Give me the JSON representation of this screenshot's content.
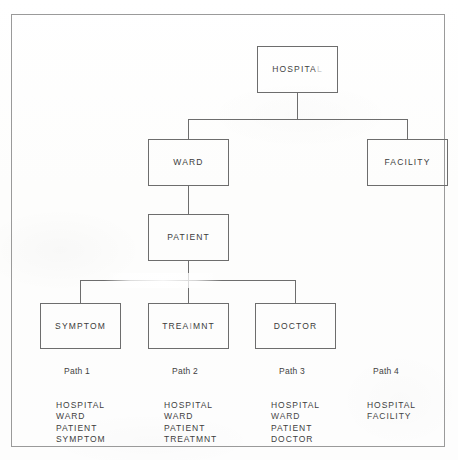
{
  "diagram": {
    "type": "hierarchical-tree",
    "title_present": false,
    "frame": {
      "border_color": "#9a9a9a"
    },
    "line_color": "#6d6d6d",
    "text_color": "#3d3d3d",
    "background_color": "#fdfdfd",
    "nodes": [
      {
        "id": "hospital",
        "label": "HOSPITAL",
        "level": 0
      },
      {
        "id": "ward",
        "label": "WARD",
        "level": 1
      },
      {
        "id": "facility",
        "label": "FACILITY",
        "level": 1
      },
      {
        "id": "patient",
        "label": "PATIENT",
        "level": 2
      },
      {
        "id": "symptom",
        "label": "SYMPTOM",
        "level": 3
      },
      {
        "id": "treatmnt",
        "label": "TREAIMNT",
        "level": 3
      },
      {
        "id": "doctor",
        "label": "DOCTOR",
        "level": 3
      }
    ],
    "edges": [
      {
        "from": "hospital",
        "to": "ward"
      },
      {
        "from": "hospital",
        "to": "facility"
      },
      {
        "from": "ward",
        "to": "patient"
      },
      {
        "from": "patient",
        "to": "symptom"
      },
      {
        "from": "patient",
        "to": "treatmnt"
      },
      {
        "from": "patient",
        "to": "doctor"
      }
    ]
  },
  "paths": [
    {
      "title": "Path 1",
      "steps": [
        "HOSPITAL",
        "WARD",
        "PATIENT",
        "SYMPTOM"
      ]
    },
    {
      "title": "Path 2",
      "steps": [
        "HOSPITAL",
        "WARD",
        "PATIENT",
        "TREATMNT"
      ]
    },
    {
      "title": "Path 3",
      "steps": [
        "HOSPITAL",
        "WARD",
        "PATIENT",
        "DOCTOR"
      ]
    },
    {
      "title": "Path 4",
      "steps": [
        "HOSPITAL",
        "FACILITY"
      ]
    }
  ]
}
